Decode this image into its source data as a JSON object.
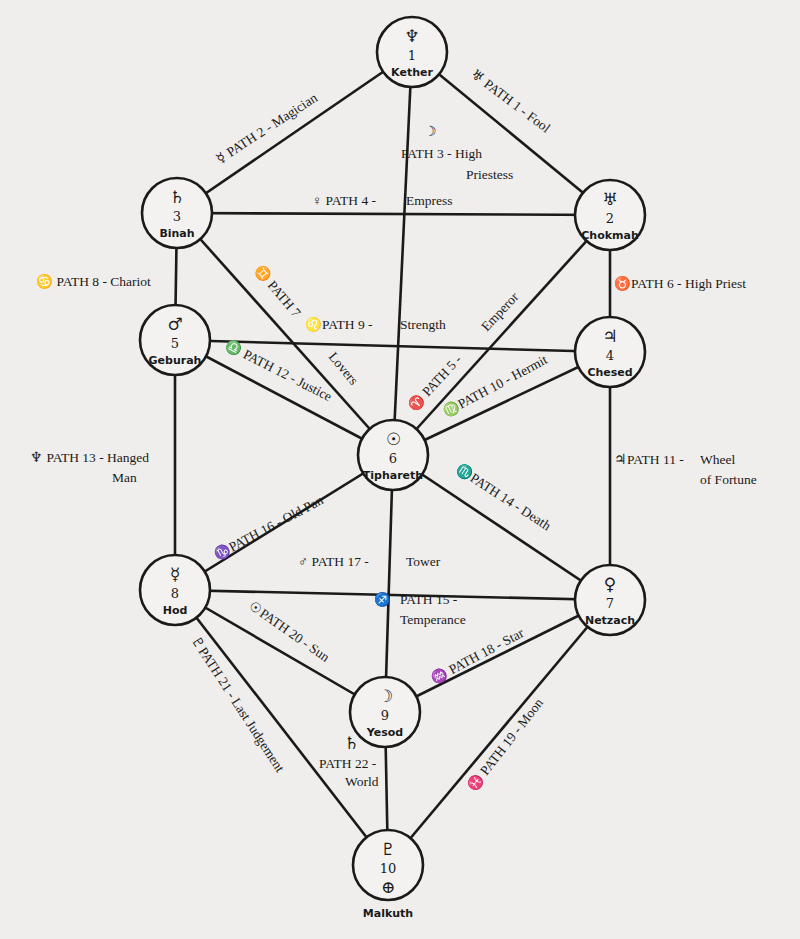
{
  "diagram": {
    "nodes": [
      {
        "id": "1",
        "number": "1",
        "name": "Kether",
        "symbol": "♆",
        "x": 412,
        "y": 52
      },
      {
        "id": "2",
        "number": "2",
        "name": "Chokmah",
        "symbol": "♅",
        "x": 610,
        "y": 215
      },
      {
        "id": "3",
        "number": "3",
        "name": "Binah",
        "symbol": "♄",
        "x": 177,
        "y": 213
      },
      {
        "id": "4",
        "number": "4",
        "name": "Chesed",
        "symbol": "♃",
        "x": 610,
        "y": 352
      },
      {
        "id": "5",
        "number": "5",
        "name": "Geburah",
        "symbol": "♂",
        "x": 175,
        "y": 340
      },
      {
        "id": "6",
        "number": "6",
        "name": "Tiphareth",
        "symbol": "☉",
        "x": 393,
        "y": 455
      },
      {
        "id": "7",
        "number": "7",
        "name": "Netzach",
        "symbol": "♀",
        "x": 610,
        "y": 600
      },
      {
        "id": "8",
        "number": "8",
        "name": "Hod",
        "symbol": "☿",
        "x": 175,
        "y": 590
      },
      {
        "id": "9",
        "number": "9",
        "name": "Yesod",
        "symbol": "☽",
        "x": 385,
        "y": 712
      },
      {
        "id": "10",
        "number": "10",
        "name": "Malkuth",
        "symbol": "♇",
        "symbol2": "⊕",
        "x": 388,
        "y": 865
      }
    ],
    "paths": [
      {
        "from": "1",
        "to": "2",
        "symbol": "♅",
        "label": "PATH 1 - Fool"
      },
      {
        "from": "1",
        "to": "3",
        "symbol": "☿",
        "label": "PATH 2 - Magician"
      },
      {
        "from": "1",
        "to": "6",
        "symbol": "☽",
        "label": "PATH 3 - High",
        "label2": "Priestess"
      },
      {
        "from": "3",
        "to": "2",
        "symbol": "♀",
        "label": "PATH 4 -",
        "label2": "Empress"
      },
      {
        "from": "2",
        "to": "6",
        "symbol": "♈",
        "label": "PATH 5 -",
        "label2": "Emperor"
      },
      {
        "from": "2",
        "to": "4",
        "symbol": "♉",
        "label": "PATH 6 - High Priest"
      },
      {
        "from": "3",
        "to": "6",
        "symbol": "♊",
        "label": "PATH 7",
        "label2": "Lovers"
      },
      {
        "from": "3",
        "to": "5",
        "symbol": "♋",
        "label": "PATH 8 - Chariot"
      },
      {
        "from": "5",
        "to": "4",
        "symbol": "♌",
        "label": "PATH 9 -",
        "label2": "Strength"
      },
      {
        "from": "4",
        "to": "6",
        "symbol": "♍",
        "label": "PATH 10 - Hermit"
      },
      {
        "from": "4",
        "to": "7",
        "symbol": "♃",
        "label": "PATH 11 -",
        "label2": "Wheel",
        "label3": "of Fortune"
      },
      {
        "from": "5",
        "to": "6",
        "symbol": "♎",
        "label": "PATH 12 - Justice"
      },
      {
        "from": "5",
        "to": "8",
        "symbol": "♆",
        "label": "PATH 13 - Hanged",
        "label2": "Man"
      },
      {
        "from": "6",
        "to": "7",
        "symbol": "♏",
        "label": "PATH 14 - Death"
      },
      {
        "from": "6",
        "to": "9",
        "symbol": "♐",
        "label": "PATH 15 -",
        "label2": "Temperance"
      },
      {
        "from": "6",
        "to": "8",
        "symbol": "♑",
        "label": "PATH 16 - Old Pan"
      },
      {
        "from": "8",
        "to": "7",
        "symbol": "♂",
        "label": "PATH 17 -",
        "label2": "Tower"
      },
      {
        "from": "7",
        "to": "9",
        "symbol": "♒",
        "label": "PATH 18 - Star"
      },
      {
        "from": "7",
        "to": "10",
        "symbol": "♓",
        "label": "PATH 19 - Moon"
      },
      {
        "from": "8",
        "to": "9",
        "symbol": "☉",
        "label": "PATH 20 - Sun"
      },
      {
        "from": "8",
        "to": "10",
        "symbol": "♇",
        "label": "PATH 21 - Last Judgement"
      },
      {
        "from": "9",
        "to": "10",
        "symbol": "♄",
        "label": "PATH 22 -",
        "label2": "World"
      }
    ]
  }
}
